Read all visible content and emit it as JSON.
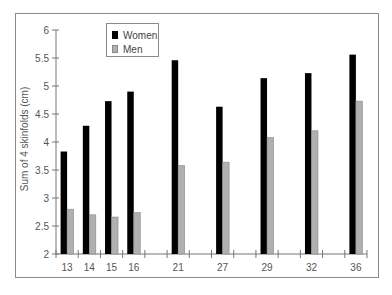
{
  "chart_data": {
    "type": "bar",
    "title": "",
    "xlabel": "",
    "ylabel": "Sum of 4 skinfolds (cm)",
    "ylim": [
      2,
      6
    ],
    "yticks": [
      2,
      2.5,
      3,
      3.5,
      4,
      4.5,
      5,
      5.5,
      6
    ],
    "ytick_labels": [
      "2",
      "2.5",
      "3",
      "3.5",
      "4",
      "4.5",
      "5",
      "5.5",
      "6"
    ],
    "categories": [
      "13",
      "14",
      "15",
      "16",
      "21",
      "27",
      "29",
      "32",
      "36"
    ],
    "slot_positions": [
      0,
      1,
      2,
      3,
      5,
      7,
      9,
      11,
      13
    ],
    "slot_count": 14,
    "grid": false,
    "legend_position": "upper-left-inside",
    "series": [
      {
        "name": "Women",
        "color": "#000000",
        "values": [
          3.83,
          4.29,
          4.73,
          4.9,
          5.46,
          4.63,
          5.14,
          5.23,
          5.56
        ]
      },
      {
        "name": "Men",
        "color": "#b0b0b0",
        "values": [
          2.8,
          2.7,
          2.66,
          2.74,
          3.58,
          3.64,
          4.08,
          4.2,
          4.73
        ]
      }
    ]
  },
  "legend": {
    "items": [
      {
        "label": "Women",
        "color": "#000000"
      },
      {
        "label": "Men",
        "color": "#b0b0b0"
      }
    ]
  }
}
